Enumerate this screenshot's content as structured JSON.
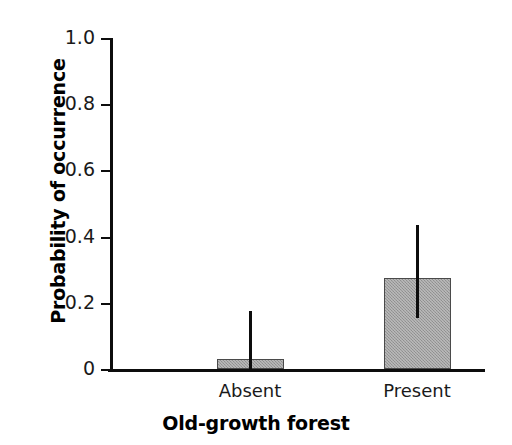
{
  "chart_data": {
    "type": "bar",
    "title": "",
    "subtitle": "",
    "xlabel": "Old-growth forest",
    "ylabel": "Probability of occurrence",
    "categories": [
      "Absent",
      "Present"
    ],
    "values": [
      0.03,
      0.275
    ],
    "error_low": [
      0.03,
      0.12
    ],
    "error_high": [
      0.145,
      0.16
    ],
    "ci_lower": [
      0.0,
      0.155
    ],
    "ci_upper": [
      0.175,
      0.435
    ],
    "series": [
      {
        "name": "Probability of occurrence",
        "values": [
          0.03,
          0.275
        ],
        "ci_lower": [
          0.0,
          0.155
        ],
        "ci_upper": [
          0.175,
          0.435
        ]
      }
    ],
    "ylim": [
      0,
      1.0
    ],
    "yticks": [
      0,
      0.2,
      0.4,
      0.6,
      0.8,
      1.0
    ],
    "ytick_labels": [
      "0",
      "0.2",
      "0.4",
      "0.6",
      "0.8",
      "1.0"
    ],
    "grid": false,
    "legend": false,
    "legend_position": "none",
    "bar_color": "#9b9b9b",
    "bar_edge_color": "#4a4a4a",
    "errorbar_color": "#0d0d0d",
    "axis_color": "#0d0d0d",
    "background_color": "#ffffff"
  }
}
